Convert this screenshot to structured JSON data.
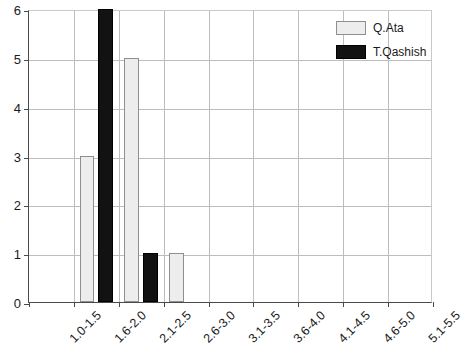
{
  "chart_data": {
    "type": "bar",
    "title": "",
    "subtitle": "",
    "xlabel": "",
    "ylabel": "",
    "categories": [
      "1.0-1.5",
      "1.6-2.0",
      "2.1-2.5",
      "2.6-3.0",
      "3.1-3.5",
      "3.6-4.0",
      "4.1-4.5",
      "4.6-5.0",
      "5.1-5.5"
    ],
    "series": [
      {
        "name": "Q.Ata",
        "color": "#ededed",
        "edge_color": "#8f8f8f",
        "values": [
          0,
          3,
          5,
          1,
          0,
          0,
          0,
          0,
          0
        ]
      },
      {
        "name": "T.Qashish",
        "color": "#121212",
        "edge_color": "#000000",
        "values": [
          0,
          6,
          1,
          0,
          0,
          0,
          0,
          0,
          0
        ]
      }
    ],
    "series_draw_order": [
      "T.Qashish",
      "Q.Ata"
    ],
    "ylim": [
      0,
      6
    ],
    "yticks": [
      0,
      1,
      2,
      3,
      4,
      5,
      6
    ],
    "ytick_labels": [
      "0",
      "1",
      "2",
      "3",
      "4",
      "5",
      "6"
    ],
    "grid": true,
    "grid_axis": "both",
    "grid_color": "#bdbdbd",
    "axis_color": "#4a4a4a",
    "background_color": "#ffffff",
    "xtick_rotation": -45,
    "legend": {
      "position": "top-right",
      "entries": [
        {
          "label": "Q.Ata",
          "swatch": "light-gray-filled"
        },
        {
          "label": "T.Qashish",
          "swatch": "black-filled"
        }
      ]
    }
  }
}
